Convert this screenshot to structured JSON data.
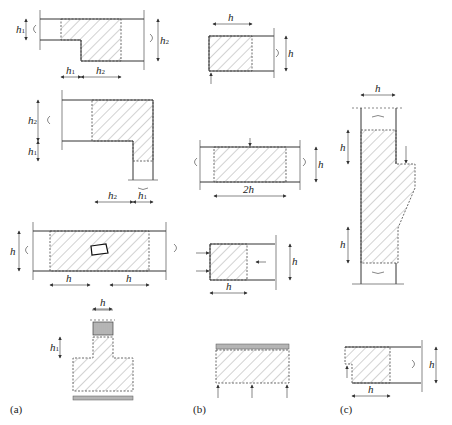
{
  "figure": {
    "panels": [
      {
        "id": "a",
        "label": "(a)"
      },
      {
        "id": "b",
        "label": "(b)"
      },
      {
        "id": "c",
        "label": "(c)"
      }
    ],
    "labels": {
      "h": "h",
      "two_h": "2h",
      "h1": "h",
      "h1_sub": "1",
      "h2": "h",
      "h2_sub": "2"
    },
    "colors": {
      "line": "#333333",
      "hatch": "#555555",
      "background": "#ffffff"
    }
  }
}
